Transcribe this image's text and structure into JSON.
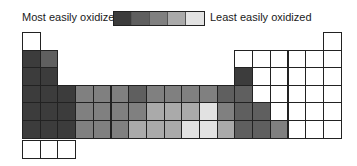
{
  "legend": {
    "left_label": "Most easily oxidized",
    "right_label": "Least easily oxidized",
    "swatches": [
      "#3c3c3c",
      "#5f5f5f",
      "#808080",
      "#aaaaaa",
      "#e2e2e2"
    ]
  },
  "shade_colors": {
    "0": "#ffffff",
    "1": "#3c3c3c",
    "2": "#5f5f5f",
    "3": "#808080",
    "4": "#aaaaaa",
    "5": "#e2e2e2"
  },
  "table": {
    "columns": 18,
    "cell_width": 17.7,
    "row_tops": [
      0,
      17.5,
      35,
      52.5,
      70,
      88,
      108
    ],
    "rows": [
      {
        "row": 1,
        "cells": [
          {
            "col": 1,
            "shade": 0
          },
          {
            "col": 18,
            "shade": 0
          }
        ]
      },
      {
        "row": 2,
        "cells": [
          {
            "col": 1,
            "shade": 1
          },
          {
            "col": 2,
            "shade": 2
          },
          {
            "col": 13,
            "shade": 0
          },
          {
            "col": 14,
            "shade": 0
          },
          {
            "col": 15,
            "shade": 0
          },
          {
            "col": 16,
            "shade": 0
          },
          {
            "col": 17,
            "shade": 0
          },
          {
            "col": 18,
            "shade": 0
          }
        ]
      },
      {
        "row": 3,
        "cells": [
          {
            "col": 1,
            "shade": 1
          },
          {
            "col": 2,
            "shade": 1
          },
          {
            "col": 13,
            "shade": 1
          },
          {
            "col": 14,
            "shade": 0
          },
          {
            "col": 15,
            "shade": 0
          },
          {
            "col": 16,
            "shade": 0
          },
          {
            "col": 17,
            "shade": 0
          },
          {
            "col": 18,
            "shade": 0
          }
        ]
      },
      {
        "row": 4,
        "cells": [
          {
            "col": 1,
            "shade": 1
          },
          {
            "col": 2,
            "shade": 1
          },
          {
            "col": 3,
            "shade": 1
          },
          {
            "col": 4,
            "shade": 3
          },
          {
            "col": 5,
            "shade": 3
          },
          {
            "col": 6,
            "shade": 3
          },
          {
            "col": 7,
            "shade": 2
          },
          {
            "col": 8,
            "shade": 3
          },
          {
            "col": 9,
            "shade": 3
          },
          {
            "col": 10,
            "shade": 3
          },
          {
            "col": 11,
            "shade": 3
          },
          {
            "col": 12,
            "shade": 2
          },
          {
            "col": 13,
            "shade": 2
          },
          {
            "col": 14,
            "shade": 0
          },
          {
            "col": 15,
            "shade": 0
          },
          {
            "col": 16,
            "shade": 0
          },
          {
            "col": 17,
            "shade": 0
          },
          {
            "col": 18,
            "shade": 0
          }
        ]
      },
      {
        "row": 5,
        "cells": [
          {
            "col": 1,
            "shade": 1
          },
          {
            "col": 2,
            "shade": 1
          },
          {
            "col": 3,
            "shade": 1
          },
          {
            "col": 4,
            "shade": 3
          },
          {
            "col": 5,
            "shade": 3
          },
          {
            "col": 6,
            "shade": 3
          },
          {
            "col": 7,
            "shade": 3
          },
          {
            "col": 8,
            "shade": 4
          },
          {
            "col": 9,
            "shade": 4
          },
          {
            "col": 10,
            "shade": 4
          },
          {
            "col": 11,
            "shade": 5
          },
          {
            "col": 12,
            "shade": 3
          },
          {
            "col": 13,
            "shade": 2
          },
          {
            "col": 14,
            "shade": 2
          },
          {
            "col": 15,
            "shade": 0
          },
          {
            "col": 16,
            "shade": 0
          },
          {
            "col": 17,
            "shade": 0
          },
          {
            "col": 18,
            "shade": 0
          }
        ]
      },
      {
        "row": 6,
        "cells": [
          {
            "col": 1,
            "shade": 1
          },
          {
            "col": 2,
            "shade": 1
          },
          {
            "col": 3,
            "shade": 1
          },
          {
            "col": 4,
            "shade": 3
          },
          {
            "col": 5,
            "shade": 3
          },
          {
            "col": 6,
            "shade": 3
          },
          {
            "col": 7,
            "shade": 4
          },
          {
            "col": 8,
            "shade": 4
          },
          {
            "col": 9,
            "shade": 4
          },
          {
            "col": 10,
            "shade": 5
          },
          {
            "col": 11,
            "shade": 5
          },
          {
            "col": 12,
            "shade": 4
          },
          {
            "col": 13,
            "shade": 2
          },
          {
            "col": 14,
            "shade": 2
          },
          {
            "col": 15,
            "shade": 3
          },
          {
            "col": 16,
            "shade": 0
          },
          {
            "col": 17,
            "shade": 0
          },
          {
            "col": 18,
            "shade": 0
          }
        ]
      },
      {
        "row": 7,
        "cells": [
          {
            "col": 1,
            "shade": 0
          },
          {
            "col": 2,
            "shade": 0
          },
          {
            "col": 3,
            "shade": 0
          }
        ]
      }
    ]
  }
}
